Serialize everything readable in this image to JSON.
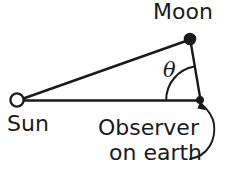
{
  "figure": {
    "width": 229,
    "height": 178,
    "background_color": "#ffffff",
    "stroke_color": "#1a1a1a",
    "labels": {
      "moon": "Moon",
      "sun": "Sun",
      "observer": "Observer",
      "on_earth": "on earth",
      "angle_symbol": "θ"
    },
    "nodes": [
      {
        "name": "sun",
        "label": "Sun",
        "marker": "open-circle",
        "x": 17,
        "y": 100,
        "radius": 7
      },
      {
        "name": "moon",
        "label": "Moon",
        "marker": "filled-circle",
        "x": 190,
        "y": 39,
        "radius": 5.5
      },
      {
        "name": "observer",
        "label": "Observer on earth",
        "marker": "filled-dot",
        "x": 200,
        "y": 100,
        "radius": 3.5
      }
    ],
    "edges": [
      {
        "name": "sun-to-moon",
        "from": "sun",
        "to": "moon"
      },
      {
        "name": "sun-to-observer",
        "from": "sun",
        "to": "observer"
      },
      {
        "name": "moon-to-observer",
        "from": "moon",
        "to": "observer"
      }
    ],
    "angle_arc": {
      "name": "theta-arc",
      "vertex": "observer",
      "radius": 34,
      "between": [
        "moon-to-observer",
        "sun-to-observer"
      ],
      "symbol": "θ"
    },
    "pointer": {
      "name": "observer-callout-arrow",
      "from_label": "on earth",
      "to_node": "observer",
      "style": "curved-arrow"
    }
  }
}
